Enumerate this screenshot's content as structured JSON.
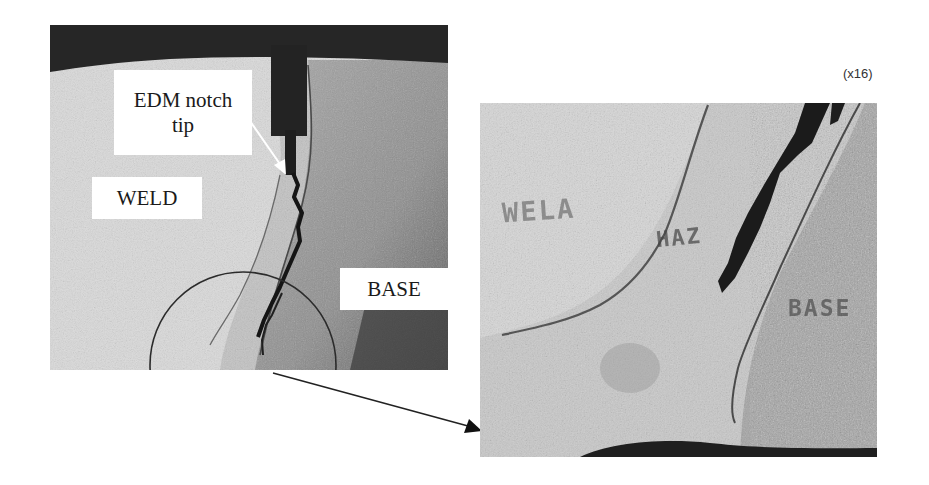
{
  "figure": {
    "left_panel": {
      "labels": {
        "edm_line1": "EDM notch",
        "edm_line2": "tip",
        "weld": "WELD",
        "base": "BASE"
      }
    },
    "right_panel": {
      "magnification": "(x16)",
      "etched_labels": {
        "weld": "WELA",
        "haz": "HAZ",
        "base": "BASE"
      }
    },
    "colors": {
      "background": "#ffffff",
      "weld_metal": "#d9d9d9",
      "haz": "#c4c4c4",
      "base_metal": "#9a9a9a",
      "crack": "#1c1c1c",
      "arrow": "#222222"
    }
  }
}
